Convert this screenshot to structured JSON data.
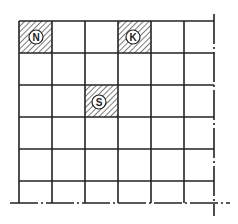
{
  "diagram": {
    "type": "grid",
    "rows": 6,
    "cols": 6,
    "line_color": "#222222",
    "hatch_color": "#333333",
    "background": "#ffffff",
    "marked_cells": [
      {
        "label": "N",
        "row": 0,
        "col": 0
      },
      {
        "label": "K",
        "row": 0,
        "col": 3
      },
      {
        "label": "S",
        "row": 2,
        "col": 2
      }
    ]
  }
}
